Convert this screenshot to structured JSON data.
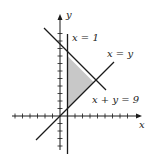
{
  "diagram": {
    "type": "region-plot",
    "axes": {
      "x_label": "x",
      "y_label": "y",
      "x_range": [
        -6,
        10
      ],
      "y_range": [
        -5,
        12
      ],
      "tick_spacing": 1
    },
    "lines": [
      {
        "id": "x-eq-1",
        "label": "x = 1",
        "equation": "x = 1"
      },
      {
        "id": "x-eq-y",
        "label": "x = y",
        "equation": "y = x"
      },
      {
        "id": "x-plus-y-eq-9",
        "label": "x + y = 9",
        "equation": "y = 9 - x"
      }
    ],
    "shaded_region": {
      "description": "Triangle bounded by x = 1, y = x, and x + y = 9",
      "vertices": [
        [
          1,
          1
        ],
        [
          1,
          8
        ],
        [
          4.5,
          4.5
        ]
      ],
      "fill": "#c8c8c8"
    },
    "colors": {
      "line": "#1a1a1a",
      "shade": "#c8c8c8",
      "background": "#ffffff"
    }
  }
}
